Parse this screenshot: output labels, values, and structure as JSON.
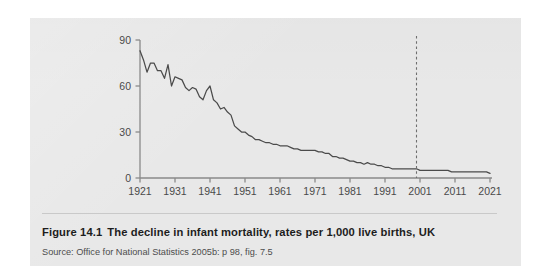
{
  "figure": {
    "number": "Figure 14.1",
    "title": "The decline in infant mortality, rates per 1,000 live births, UK",
    "source": "Source: Office for National Statistics 2005b: p 98, fig. 7.5"
  },
  "colors": {
    "panel_background": "#e8e8e8",
    "page_background": "#ffffff",
    "line": "#4b4b4b",
    "axis": "#8a8a8a",
    "tick_label": "#4a4a4a",
    "projection_marker": "#6e6e6e"
  },
  "chart_data": {
    "type": "line",
    "title": "",
    "xlabel": "",
    "ylabel": "",
    "xlim": [
      1921,
      2021
    ],
    "ylim": [
      0,
      90
    ],
    "yticks": [
      0,
      30,
      60,
      90
    ],
    "xticks": [
      1921,
      1931,
      1941,
      1951,
      1961,
      1971,
      1981,
      1991,
      2001,
      2011,
      2021
    ],
    "grid": false,
    "legend": "none",
    "annotations": [
      {
        "type": "vertical-dashed-line",
        "x": 2000,
        "label": "",
        "note": "projection boundary"
      }
    ],
    "series": [
      {
        "name": "Infant mortality rate per 1,000 live births",
        "x": [
          1921,
          1922,
          1923,
          1924,
          1925,
          1926,
          1927,
          1928,
          1929,
          1930,
          1931,
          1932,
          1933,
          1934,
          1935,
          1936,
          1937,
          1938,
          1939,
          1940,
          1941,
          1942,
          1943,
          1944,
          1945,
          1946,
          1947,
          1948,
          1949,
          1950,
          1951,
          1952,
          1953,
          1954,
          1955,
          1956,
          1957,
          1958,
          1959,
          1960,
          1961,
          1962,
          1963,
          1964,
          1965,
          1966,
          1967,
          1968,
          1969,
          1970,
          1971,
          1972,
          1973,
          1974,
          1975,
          1976,
          1977,
          1978,
          1979,
          1980,
          1981,
          1982,
          1983,
          1984,
          1985,
          1986,
          1987,
          1988,
          1989,
          1990,
          1991,
          1992,
          1993,
          1994,
          1995,
          1996,
          1997,
          1998,
          1999,
          2000,
          2001,
          2002,
          2003,
          2004,
          2005,
          2006,
          2007,
          2008,
          2009,
          2010,
          2011,
          2012,
          2013,
          2014,
          2015,
          2016,
          2017,
          2018,
          2019,
          2020,
          2021
        ],
        "values": [
          83,
          77,
          69,
          75,
          75,
          70,
          70,
          65,
          74,
          60,
          66,
          65,
          64,
          59,
          57,
          59,
          58,
          53,
          51,
          57,
          60,
          51,
          49,
          45,
          46,
          43,
          41,
          34,
          32,
          30,
          30,
          28,
          27,
          25,
          25,
          24,
          23,
          23,
          22,
          22,
          21,
          21,
          21,
          20,
          19,
          19,
          18,
          18,
          18,
          18,
          18,
          17,
          17,
          16,
          16,
          14,
          14,
          13,
          13,
          12,
          11,
          11,
          10,
          10,
          9,
          10,
          9,
          9,
          8,
          8,
          7,
          7,
          6,
          6,
          6,
          6,
          6,
          6,
          6,
          6,
          5,
          5,
          5,
          5,
          5,
          5,
          5,
          5,
          5,
          4,
          4,
          4,
          4,
          4,
          4,
          4,
          4,
          4,
          4,
          4,
          3
        ]
      }
    ]
  }
}
